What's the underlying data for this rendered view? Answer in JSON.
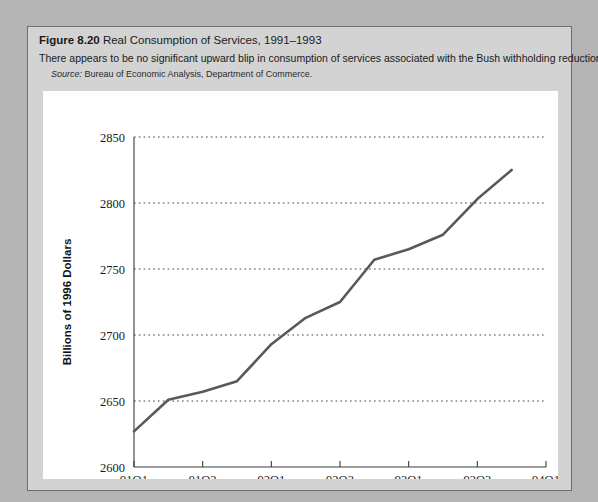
{
  "figure": {
    "number_label": "Figure 8.20",
    "title": "Real Consumption of Services, 1991–1993",
    "subtitle": "There appears to be no significant upward blip in consumption of services associated with the Bush withholding reduction.",
    "source_label": "Source:",
    "source_text": "Bureau of Economic Analysis, Department of Commerce."
  },
  "colors": {
    "page_background": "#b4b4b4",
    "figure_background": "#d3d3d3",
    "plot_background": "#ffffff",
    "line_color": "#59595c",
    "axis_color": "#3a3a3a",
    "grid_color": "#3f3f3f"
  },
  "chart_data": {
    "type": "line",
    "title": "Real Consumption of Services, 1991–1993",
    "xlabel": "Quarter",
    "ylabel": "Billions of 1996 Dollars",
    "ylim": [
      2600,
      2850
    ],
    "ytick_labels": [
      "2600",
      "2650",
      "2700",
      "2750",
      "2800",
      "2850"
    ],
    "yticks": [
      2600,
      2650,
      2700,
      2750,
      2800,
      2850
    ],
    "grid": true,
    "grid_axis": "y",
    "legend": "none",
    "xtick_labels": [
      "91Q1",
      "91Q3",
      "92Q1",
      "92Q3",
      "93Q1",
      "93Q3",
      "94Q1"
    ],
    "x": [
      "91Q1",
      "91Q2",
      "91Q3",
      "91Q4",
      "92Q1",
      "92Q2",
      "92Q3",
      "92Q4",
      "93Q1",
      "93Q2",
      "93Q3",
      "93Q4"
    ],
    "values": [
      2627,
      2651,
      2657,
      2665,
      2693,
      2713,
      2725,
      2757,
      2765,
      2776,
      2803,
      2825
    ]
  }
}
